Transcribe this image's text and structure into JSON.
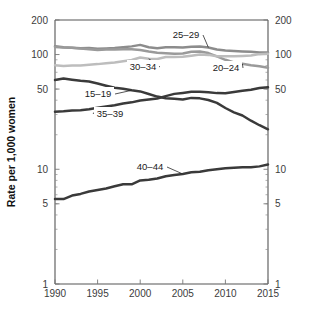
{
  "chart_data": {
    "type": "line",
    "title": "",
    "xlabel": "",
    "ylabel": "Rate per 1,000 women",
    "xlim": [
      1990,
      2015
    ],
    "ylim": [
      1,
      200
    ],
    "yscale": "log",
    "grid": false,
    "legend_position": "inline-annotations",
    "x_ticks": [
      1990,
      1995,
      2000,
      2005,
      2010,
      2015
    ],
    "x_tick_labels": [
      "1990",
      "1995",
      "2000",
      "2005",
      "2010",
      "2015"
    ],
    "y_ticks": [
      1,
      5,
      10,
      50,
      100,
      200
    ],
    "y_tick_labels": [
      "1",
      "5",
      "10",
      "50",
      "100",
      "200"
    ],
    "y_axis_left_labels": [
      "200",
      "100",
      "50",
      "10",
      "5",
      "1"
    ],
    "y_axis_right_labels": [
      "200",
      "100",
      "50",
      "10",
      "5",
      "1"
    ],
    "x": [
      1990,
      1991,
      1992,
      1993,
      1994,
      1995,
      1996,
      1997,
      1998,
      1999,
      2000,
      2001,
      2002,
      2003,
      2004,
      2005,
      2006,
      2007,
      2008,
      2009,
      2010,
      2011,
      2012,
      2013,
      2014,
      2015
    ],
    "series": [
      {
        "name": "25-29",
        "label": "25–29",
        "color": "#8c8c8c",
        "values": [
          118.2,
          115.7,
          114.6,
          113.2,
          113.9,
          112.2,
          113.1,
          113.8,
          115.9,
          117.8,
          121.4,
          115.7,
          113.6,
          115.6,
          115.5,
          115.2,
          116.8,
          117.5,
          115.1,
          110.5,
          108.3,
          107.2,
          106.5,
          105.5,
          104.3,
          104.3
        ]
      },
      {
        "name": "20-24",
        "label": "20–24",
        "color": "#9a9a9a",
        "values": [
          116.5,
          115.3,
          114.6,
          112.6,
          111.1,
          109.8,
          110.4,
          110.4,
          111.2,
          111.0,
          109.7,
          106.2,
          103.6,
          102.6,
          101.7,
          102.2,
          105.9,
          106.3,
          103.0,
          96.3,
          90.0,
          85.3,
          83.1,
          80.7,
          79.0,
          76.8
        ]
      },
      {
        "name": "30-34",
        "label": "30–34",
        "color": "#bdbdbd",
        "values": [
          80.8,
          79.5,
          80.2,
          80.1,
          81.5,
          82.5,
          83.9,
          85.3,
          87.4,
          89.6,
          94.1,
          91.9,
          91.5,
          95.1,
          95.3,
          95.8,
          97.7,
          99.9,
          99.3,
          96.5,
          96.5,
          96.5,
          97.3,
          98.0,
          100.8,
          101.5
        ]
      },
      {
        "name": "15-19",
        "label": "15–19",
        "color": "#3a3a3a",
        "values": [
          59.9,
          61.8,
          60.3,
          59.0,
          58.2,
          56.0,
          53.5,
          51.3,
          50.3,
          48.8,
          47.7,
          45.3,
          43.0,
          41.6,
          41.1,
          40.5,
          41.9,
          41.5,
          40.2,
          37.9,
          34.2,
          31.3,
          29.4,
          26.5,
          24.2,
          22.3
        ]
      },
      {
        "name": "35-39",
        "label": "35–39",
        "color": "#3a3a3a",
        "values": [
          31.7,
          32.0,
          32.5,
          32.7,
          33.4,
          34.3,
          35.3,
          36.1,
          37.4,
          38.3,
          39.7,
          40.6,
          41.4,
          43.4,
          45.4,
          46.3,
          47.3,
          47.5,
          46.9,
          46.1,
          45.9,
          47.2,
          48.3,
          49.3,
          51.0,
          51.8
        ]
      },
      {
        "name": "40-44",
        "label": "40–44",
        "color": "#3a3a3a",
        "values": [
          5.5,
          5.5,
          5.9,
          6.1,
          6.4,
          6.6,
          6.8,
          7.1,
          7.4,
          7.4,
          8.0,
          8.1,
          8.3,
          8.7,
          8.9,
          9.1,
          9.4,
          9.5,
          9.8,
          10.0,
          10.2,
          10.3,
          10.4,
          10.4,
          10.6,
          11.0
        ]
      }
    ]
  }
}
